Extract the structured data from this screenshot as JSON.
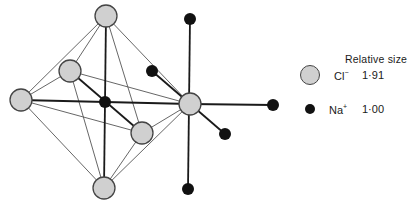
{
  "diagram": {
    "cl_atoms": [
      {
        "id": "cl-top",
        "x": 106,
        "y": 16,
        "r": 11
      },
      {
        "id": "cl-left",
        "x": 21,
        "y": 100,
        "r": 11
      },
      {
        "id": "cl-bottom",
        "x": 104,
        "y": 188,
        "r": 11
      },
      {
        "id": "cl-back-left",
        "x": 70,
        "y": 71,
        "r": 11
      },
      {
        "id": "cl-front-right",
        "x": 142,
        "y": 133,
        "r": 11
      },
      {
        "id": "cl-right-center",
        "x": 190,
        "y": 104,
        "r": 11
      }
    ],
    "na_atoms": [
      {
        "id": "na-octa-center",
        "x": 105,
        "y": 102,
        "r": 6
      },
      {
        "id": "na-top",
        "x": 190,
        "y": 19,
        "r": 6
      },
      {
        "id": "na-bottom",
        "x": 188,
        "y": 189,
        "r": 6
      },
      {
        "id": "na-right",
        "x": 273,
        "y": 105,
        "r": 6
      },
      {
        "id": "na-back-left",
        "x": 152,
        "y": 71,
        "r": 6
      },
      {
        "id": "na-front-right",
        "x": 225,
        "y": 134,
        "r": 6
      }
    ],
    "colors": {
      "cl_fill": "#d0d0d0",
      "cl_stroke": "#444444",
      "na_fill": "#111111",
      "bond": "#1a1a1a",
      "edge": "#555555"
    }
  },
  "legend": {
    "title": "Relative size",
    "items": [
      {
        "ion": "Cl",
        "charge": "−",
        "value": "1·91"
      },
      {
        "ion": "Na",
        "charge": "+",
        "value": "1·00"
      }
    ]
  }
}
